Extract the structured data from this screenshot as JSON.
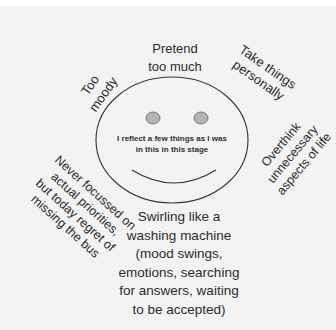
{
  "diagram": {
    "type": "smiley-face-mind-map",
    "center_text": [
      "I reflect a few things as I was",
      "in this in this stage"
    ],
    "labels": {
      "top": [
        "Pretend",
        "too much"
      ],
      "top_left": [
        "Too",
        "moody"
      ],
      "top_right": [
        "Take things",
        "personally"
      ],
      "left": [
        "Never focussed on",
        "actual priorities,",
        "but today regret of",
        "missing the bus"
      ],
      "right": [
        "Overthink",
        "unnecessary",
        "aspects of life"
      ],
      "bottom": [
        "Swirling like a",
        "washing machine",
        "(mood swings,",
        "emotions, searching",
        "for answers, waiting",
        "to be accepted)"
      ]
    },
    "colors": {
      "background": "#f3f3f3",
      "outline": "#333333",
      "eye_fill": "#b5b5b5",
      "text": "#2b2b2b"
    }
  }
}
